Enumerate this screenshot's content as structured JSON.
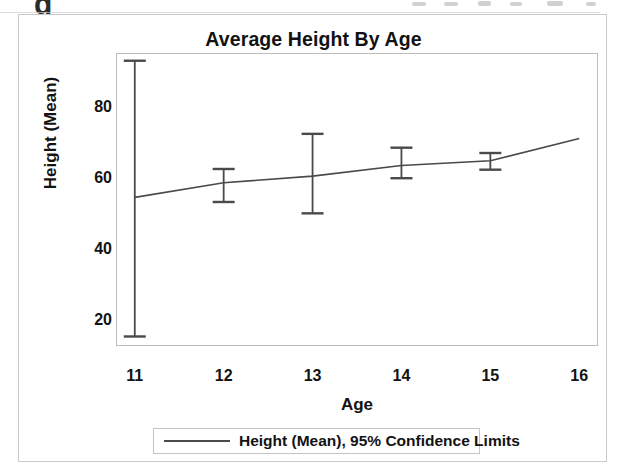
{
  "chart_data": {
    "type": "line",
    "title": "Average Height By Age",
    "xlabel": "Age",
    "ylabel": "Height (Mean)",
    "x": [
      11,
      12,
      13,
      14,
      15,
      16
    ],
    "xticks": [
      "11",
      "12",
      "13",
      "14",
      "15",
      "16"
    ],
    "yticks": [
      "20",
      "40",
      "60",
      "80"
    ],
    "ytick_values": [
      20,
      40,
      60,
      80
    ],
    "xlim": [
      10.8,
      16.2
    ],
    "ylim": [
      13,
      95
    ],
    "grid": false,
    "legend_position": "bottom-center",
    "series": [
      {
        "name": "Height (Mean), 95% Confidence Limits",
        "x": [
          11,
          12,
          13,
          14,
          15,
          16
        ],
        "values": [
          54.6,
          58.7,
          60.6,
          63.6,
          64.9,
          71.2
        ],
        "ci_lower": [
          15.4,
          53.3,
          50.1,
          60.0,
          62.4,
          null
        ],
        "ci_upper": [
          93.1,
          62.6,
          72.5,
          68.6,
          67.1,
          null
        ],
        "error_bar_ages": [
          11,
          12,
          13,
          14,
          15
        ],
        "color": "#4a4a4a"
      }
    ],
    "legend": [
      {
        "label": "Height (Mean), 95% Confidence Limits",
        "color": "#4a4a4a",
        "marker": "line"
      }
    ]
  },
  "scan": {
    "artifact_glyph": "g"
  }
}
